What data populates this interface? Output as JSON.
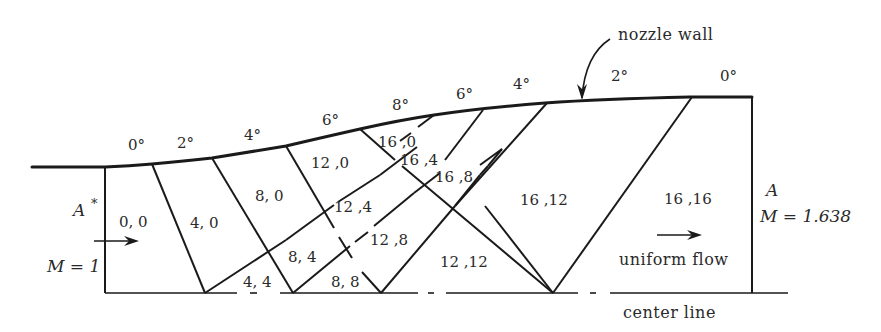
{
  "figure": {
    "labels": {
      "nozzle_wall": "nozzle wall",
      "center_line": "center line",
      "uniform_flow": "uniform flow",
      "throat_A": "A",
      "throat_star": "*",
      "throat_M": "M = 1",
      "exit_A": "A",
      "exit_M": "M = 1.638"
    },
    "wall_angles": [
      "0°",
      "2°",
      "4°",
      "6°",
      "8°",
      "6°",
      "4°",
      "2°",
      "0°"
    ],
    "regions": [
      {
        "id": "r00",
        "label": "0, 0"
      },
      {
        "id": "r40",
        "label": "4, 0"
      },
      {
        "id": "r80",
        "label": "8, 0"
      },
      {
        "id": "r44",
        "label": "4, 4"
      },
      {
        "id": "r120",
        "label": "12 ,0"
      },
      {
        "id": "r84",
        "label": "8, 4"
      },
      {
        "id": "r124",
        "label": "12 ,4"
      },
      {
        "id": "r88",
        "label": "8, 8"
      },
      {
        "id": "r160",
        "label": "16 ,0"
      },
      {
        "id": "r164",
        "label": "16 ,4"
      },
      {
        "id": "r128",
        "label": "12 ,8"
      },
      {
        "id": "r168",
        "label": "16 ,8"
      },
      {
        "id": "r1212",
        "label": "12 ,12"
      },
      {
        "id": "r1612",
        "label": "16 ,12"
      },
      {
        "id": "r1616",
        "label": "16 ,16"
      }
    ]
  }
}
